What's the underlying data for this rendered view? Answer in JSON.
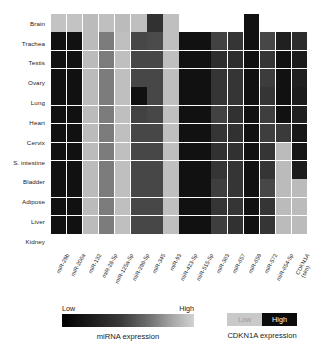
{
  "chart_data": {
    "type": "heatmap",
    "title": "",
    "xlabel": "",
    "ylabel": "",
    "grid": true,
    "legend_position": "bottom",
    "rows": [
      "Brain",
      "Trachea",
      "Testis",
      "Ovary",
      "Lung",
      "Heart",
      "Cervix",
      "S. intestine",
      "Bladder",
      "Adipose",
      "Liver",
      "Kidney"
    ],
    "columns": [
      {
        "line1": "miR-29b",
        "line2": ""
      },
      {
        "line1": "miR-206a",
        "line2": ""
      },
      {
        "line1": "miR-132",
        "line2": ""
      },
      {
        "line1": "miR-28-5p",
        "line2": ""
      },
      {
        "line1": "miR-125a-5p",
        "line2": ""
      },
      {
        "line1": "miR-299-5p",
        "line2": ""
      },
      {
        "line1": "miR-345",
        "line2": ""
      },
      {
        "line1": "miR-93",
        "line2": ""
      },
      {
        "line1": "miR-423-5p",
        "line2": ""
      },
      {
        "line1": "miR-515-5p",
        "line2": ""
      },
      {
        "line1": "miR-363",
        "line2": ""
      },
      {
        "line1": "miR-657",
        "line2": ""
      },
      {
        "line1": "miR-659",
        "line2": ""
      },
      {
        "line1": "miR-572",
        "line2": ""
      },
      {
        "line1": "miR-654-5p",
        "line2": ""
      },
      {
        "line1": "CDKN1A",
        "line2": "(sim)"
      },
      {
        "line1": "CDKN1A",
        "line2": "(exp)"
      }
    ],
    "column_labels": [
      "miR-29b",
      "miR-206a",
      "miR-132",
      "miR-28-5p",
      "miR-125a-5p",
      "miR-299-5p",
      "miR-345",
      "miR-93",
      "miR-423-5p",
      "miR-515-5p",
      "miR-363",
      "miR-657",
      "miR-659",
      "miR-572",
      "miR-654-5p",
      "CDKN1A (sim)",
      "CDKN1A (exp)"
    ],
    "colorscale": "grayscale-low-black-to-high-light",
    "values": [
      [
        0.88,
        0.88,
        0.84,
        0.86,
        0.84,
        0.86,
        0.2,
        0.86,
        null,
        null,
        null,
        null,
        0.05,
        null,
        null,
        null
      ],
      [
        0.05,
        0.05,
        0.84,
        0.55,
        0.86,
        0.3,
        0.32,
        0.86,
        0.05,
        0.05,
        0.28,
        0.22,
        0.05,
        0.3,
        0.12,
        0.18
      ],
      [
        0.05,
        0.05,
        0.84,
        0.55,
        0.86,
        0.3,
        0.3,
        0.86,
        0.05,
        0.05,
        0.18,
        0.18,
        0.05,
        0.22,
        0.05,
        0.1
      ],
      [
        0.05,
        0.05,
        0.84,
        0.55,
        0.86,
        0.3,
        0.3,
        0.86,
        0.05,
        0.05,
        0.22,
        0.22,
        0.05,
        0.25,
        0.05,
        0.12
      ],
      [
        0.05,
        0.05,
        0.84,
        0.55,
        0.86,
        0.05,
        0.3,
        0.86,
        0.05,
        0.05,
        0.22,
        0.22,
        0.05,
        0.22,
        0.05,
        0.1
      ],
      [
        0.05,
        0.05,
        0.84,
        0.55,
        0.86,
        0.28,
        0.3,
        0.86,
        0.05,
        0.05,
        0.28,
        0.2,
        0.05,
        0.26,
        0.05,
        0.12
      ],
      [
        0.05,
        0.05,
        0.84,
        0.55,
        0.86,
        0.3,
        0.3,
        0.86,
        0.05,
        0.05,
        0.22,
        0.2,
        0.05,
        0.26,
        0.24,
        0.08
      ],
      [
        0.05,
        0.05,
        0.84,
        0.55,
        0.86,
        0.3,
        0.3,
        0.86,
        0.05,
        0.05,
        0.2,
        0.2,
        0.05,
        0.22,
        0.84,
        0.08
      ],
      [
        0.05,
        0.05,
        0.84,
        0.55,
        0.86,
        0.3,
        0.3,
        0.86,
        0.05,
        0.05,
        0.22,
        0.22,
        0.05,
        0.22,
        0.84,
        0.1
      ],
      [
        0.05,
        0.05,
        0.84,
        0.55,
        0.86,
        0.3,
        0.3,
        0.86,
        0.05,
        0.05,
        0.26,
        0.22,
        0.05,
        0.3,
        0.84,
        0.84
      ],
      [
        0.05,
        0.05,
        0.84,
        0.55,
        0.86,
        0.3,
        0.3,
        0.86,
        0.05,
        0.05,
        0.22,
        0.22,
        0.05,
        0.22,
        0.84,
        0.84
      ],
      [
        0.05,
        0.05,
        0.84,
        0.55,
        0.86,
        0.3,
        0.3,
        0.86,
        0.05,
        0.05,
        0.26,
        0.2,
        0.05,
        0.22,
        0.84,
        0.84
      ]
    ]
  },
  "legends": {
    "mirna": {
      "low_label": "Low",
      "high_label": "High",
      "caption": "miRNA expression",
      "low_color": "#000000",
      "high_color": "#d2d2d2"
    },
    "cdkn1a": {
      "low_label": "Low",
      "high_label": "High",
      "caption": "CDKN1A expression",
      "low_color": "#c9c9c9",
      "high_color": "#0b0b0b"
    }
  }
}
